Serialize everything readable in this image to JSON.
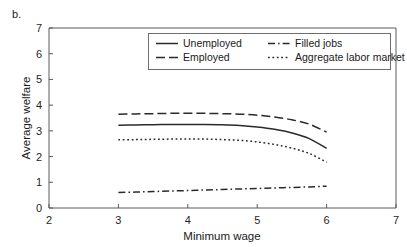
{
  "figure": {
    "panel_label": "b."
  },
  "chart_data": {
    "type": "line",
    "title": "",
    "xlabel": "Minimum wage",
    "ylabel": "Average welfare",
    "xlim": [
      2,
      7
    ],
    "ylim": [
      0,
      7
    ],
    "xticks": [
      2,
      3,
      4,
      5,
      6,
      7
    ],
    "xticklabels": [
      "2",
      "3",
      "4",
      "5",
      "6",
      "7"
    ],
    "yticks": [
      0,
      1,
      2,
      3,
      4,
      5,
      6,
      7
    ],
    "yticklabels": [
      "0",
      "1",
      "2",
      "3",
      "4",
      "5",
      "6",
      "7"
    ],
    "grid": false,
    "legend_position": "upper center",
    "x": [
      3.0,
      3.25,
      3.5,
      3.75,
      4.0,
      4.25,
      4.5,
      4.75,
      5.0,
      5.25,
      5.5,
      5.75,
      6.0
    ],
    "series": [
      {
        "name": "Unemployed",
        "style": "solid",
        "color": "#2a2a2a",
        "values": [
          3.22,
          3.23,
          3.24,
          3.25,
          3.25,
          3.25,
          3.24,
          3.21,
          3.15,
          3.06,
          2.92,
          2.7,
          2.32
        ]
      },
      {
        "name": "Employed",
        "style": "dashed",
        "color": "#2a2a2a",
        "values": [
          3.65,
          3.66,
          3.67,
          3.68,
          3.68,
          3.68,
          3.67,
          3.65,
          3.61,
          3.54,
          3.43,
          3.26,
          2.95
        ]
      },
      {
        "name": "Filled jobs",
        "style": "dashdot",
        "color": "#2a2a2a",
        "values": [
          0.6,
          0.62,
          0.64,
          0.66,
          0.68,
          0.7,
          0.72,
          0.74,
          0.76,
          0.78,
          0.8,
          0.82,
          0.85
        ]
      },
      {
        "name": "Aggregate labor market",
        "style": "dotted",
        "color": "#2a2a2a",
        "values": [
          2.65,
          2.66,
          2.67,
          2.68,
          2.68,
          2.68,
          2.66,
          2.63,
          2.57,
          2.47,
          2.33,
          2.12,
          1.78
        ]
      }
    ],
    "legend_order": [
      "Unemployed",
      "Filled jobs",
      "Employed",
      "Aggregate labor market"
    ]
  }
}
